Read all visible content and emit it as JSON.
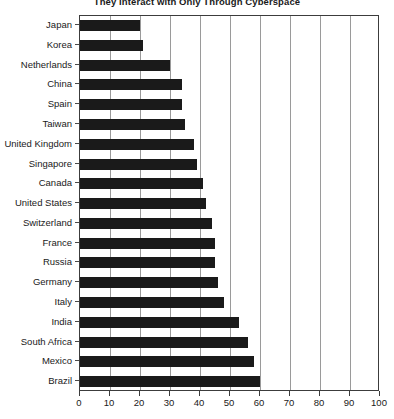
{
  "chart_data": {
    "type": "bar",
    "orientation": "horizontal",
    "title": "They Interact with Only Through Cyberspace",
    "xlabel": "",
    "ylabel": "",
    "xlim": [
      0,
      100
    ],
    "xticks": [
      0,
      10,
      20,
      30,
      40,
      50,
      60,
      70,
      80,
      90,
      100
    ],
    "grid": true,
    "legend": false,
    "bar_color": "#1a1a1a",
    "categories": [
      "Japan",
      "Korea",
      "Netherlands",
      "China",
      "Spain",
      "Taiwan",
      "United Kingdom",
      "Singapore",
      "Canada",
      "United States",
      "Switzerland",
      "France",
      "Russia",
      "Germany",
      "Italy",
      "India",
      "South Africa",
      "Mexico",
      "Brazil"
    ],
    "values": [
      20,
      21,
      30,
      34,
      34,
      35,
      38,
      39,
      41,
      42,
      44,
      45,
      45,
      46,
      48,
      53,
      56,
      58,
      60
    ]
  }
}
